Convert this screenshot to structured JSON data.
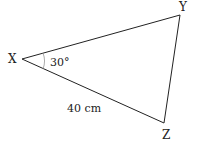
{
  "diagram": {
    "type": "triangle",
    "vertices": [
      {
        "label": "X",
        "x": 22,
        "y": 59
      },
      {
        "label": "Y",
        "x": 180,
        "y": 15
      },
      {
        "label": "Z",
        "x": 164,
        "y": 123
      }
    ],
    "angle_label": "30°",
    "side_label": "40 cm",
    "line_color": "#222222"
  }
}
